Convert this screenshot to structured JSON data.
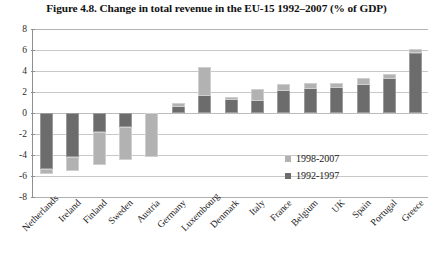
{
  "chart_data": {
    "type": "bar",
    "title": "Figure 4.8. Change in total revenue in the EU-15 1992–2007 (% of GDP)",
    "xlabel": "",
    "ylabel": "",
    "ylim": [
      -8,
      8
    ],
    "yticks": [
      8,
      6,
      4,
      2,
      0,
      -2,
      -4,
      -6,
      -8
    ],
    "grid": true,
    "legend_position": "inside-right",
    "stacked": true,
    "categories": [
      "Netherlands",
      "Ireland",
      "Finland",
      "Sweden",
      "Austria",
      "Germany",
      "Luxembourg",
      "Denmark",
      "Italy",
      "France",
      "Belgium",
      "UK",
      "Spain",
      "Portugal",
      "Greece"
    ],
    "series": [
      {
        "name": "1992–1997",
        "color": "#6c6c6c",
        "values": [
          -5.3,
          -4.2,
          -1.8,
          -1.3,
          0.0,
          1.0,
          4.4,
          1.5,
          2.3,
          2.8,
          2.9,
          2.9,
          3.3,
          3.7,
          5.7
        ]
      },
      {
        "name": "1998–2007",
        "color": "#b2b2b2",
        "values": [
          -0.5,
          -1.3,
          -3.2,
          -3.2,
          -4.2,
          -0.4,
          -2.8,
          -0.3,
          -1.2,
          -0.7,
          -0.6,
          -0.5,
          -0.6,
          -0.5,
          0.4
        ]
      }
    ],
    "totals": [
      -5.8,
      -5.5,
      -5.0,
      -4.5,
      -4.2,
      0.6,
      1.6,
      1.2,
      1.1,
      2.1,
      2.3,
      2.4,
      2.7,
      3.2,
      6.1
    ]
  },
  "legend": {
    "entries": [
      {
        "label": "1998-2007",
        "swatch": "light-gray-swatch"
      },
      {
        "label": "1992-1997",
        "swatch": "dark-gray-swatch"
      }
    ]
  }
}
